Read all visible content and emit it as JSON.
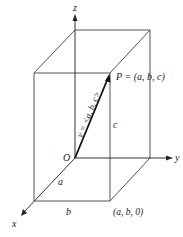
{
  "diagram": {
    "type": "3d-box-vector",
    "axes": {
      "x": "x",
      "y": "y",
      "z": "z"
    },
    "origin_label": "O",
    "point_label": "P = (a, b, c)",
    "vector_label": "v = <a, b, c>",
    "edge_labels": {
      "a": "a",
      "b": "b",
      "c": "c"
    },
    "base_point_label": "(a, b, 0)"
  }
}
